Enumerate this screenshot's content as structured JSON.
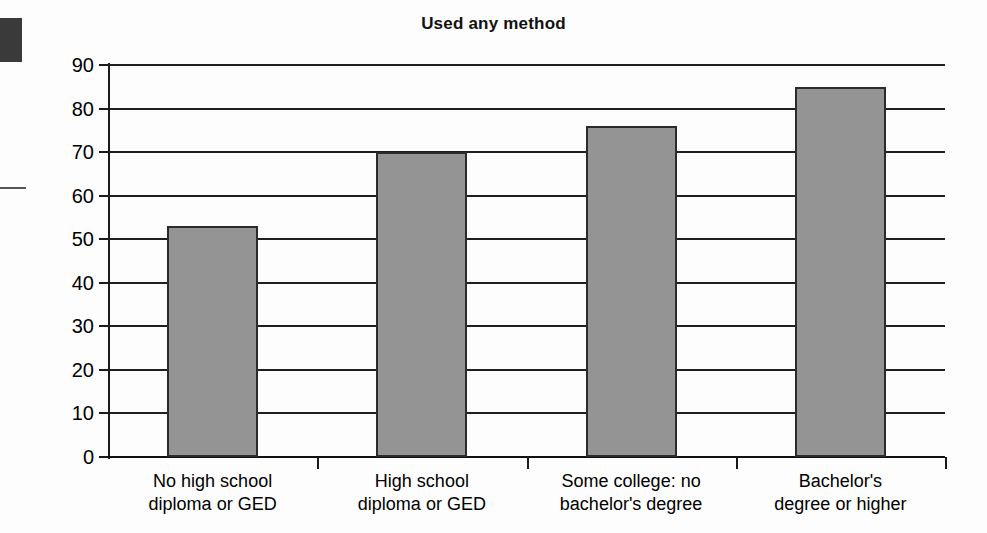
{
  "chart_data": {
    "type": "bar",
    "title": "Used any method",
    "xlabel": "",
    "ylabel": "",
    "ylim": [
      0,
      90
    ],
    "yticks": [
      0,
      10,
      20,
      30,
      40,
      50,
      60,
      70,
      80,
      90
    ],
    "grid": true,
    "legend": false,
    "categories": [
      "No high school diploma or GED",
      "High school diploma or GED",
      "Some college: no bachelor's degree",
      "Bachelor's degree or higher"
    ],
    "category_lines": [
      [
        "No high school",
        "diploma or GED"
      ],
      [
        "High school",
        "diploma or GED"
      ],
      [
        "Some college: no",
        "bachelor's degree"
      ],
      [
        "Bachelor's",
        "degree or higher"
      ]
    ],
    "values": [
      53,
      70,
      76,
      85
    ],
    "series": [
      {
        "name": "Used any method",
        "values": [
          53,
          70,
          76,
          85
        ]
      }
    ],
    "bar_color": "#949494",
    "bar_border_color": "#2b2b2b",
    "axis_color": "#1a1a1a"
  },
  "axis": {
    "y_tick_labels": [
      "90",
      "80",
      "70",
      "60",
      "50",
      "40",
      "30",
      "20",
      "10",
      "0"
    ]
  }
}
